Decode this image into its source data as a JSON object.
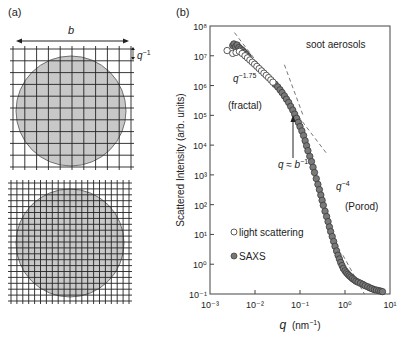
{
  "panel_a": {
    "label": "(a)",
    "dimension_label": "b",
    "grid_spacing_label": "q",
    "grid_spacing_exponent": "−1",
    "top_grid": {
      "divisions": 10,
      "circle_fill": "#c8c8c8"
    },
    "bottom_grid": {
      "divisions": 20,
      "circle_fill": "#c8c8c8"
    }
  },
  "panel_b": {
    "label": "(b)",
    "annotations": {
      "sample": "soot aerosols",
      "fractal_slope_base": "q",
      "fractal_slope_exp": "−1.75",
      "fractal_regime": "(fractal)",
      "crossover_base": "q ≈ b",
      "crossover_exp": "−1",
      "porod_slope_base": "q",
      "porod_slope_exp": "−4",
      "porod_regime": "(Porod)"
    },
    "legend": [
      {
        "label": "light scattering",
        "marker": "open-circle"
      },
      {
        "label": "SAXS",
        "marker": "filled-circle"
      }
    ]
  },
  "chart_data": {
    "type": "scatter",
    "title": "",
    "xlabel": "q (nm⁻¹)",
    "ylabel": "Scattered Intensity (arb. units)",
    "xscale": "log",
    "yscale": "log",
    "xlim": [
      0.001,
      10
    ],
    "ylim": [
      0.1,
      100000000
    ],
    "x_ticks": [
      "10⁻³",
      "10⁻²",
      "10⁻¹",
      "10⁰",
      "10¹"
    ],
    "y_ticks": [
      "10⁻¹",
      "10⁰",
      "10¹",
      "10²",
      "10³",
      "10⁴",
      "10⁵",
      "10⁶",
      "10⁷",
      "10⁸"
    ],
    "grid": false,
    "legend_position": "lower-left",
    "series": [
      {
        "name": "light scattering",
        "marker": "open-circle",
        "x": [
          0.0024,
          0.0032,
          0.0038,
          0.0045,
          0.0052,
          0.006,
          0.0068,
          0.0077,
          0.0087,
          0.0098,
          0.011,
          0.0124,
          0.014,
          0.0158,
          0.0178,
          0.02,
          0.0225,
          0.025
        ],
        "y": [
          15000000,
          12000000,
          13000000,
          14000000,
          12000000,
          10000000,
          8500000,
          7200000,
          6100000,
          5200000,
          4400000,
          3700000,
          3100000,
          2600000,
          2200000,
          1850000,
          1550000,
          1300000
        ]
      },
      {
        "name": "SAXS",
        "marker": "filled-circle",
        "x": [
          0.0032,
          0.0034,
          0.0037,
          0.004,
          0.0044,
          0.0048,
          0.0053,
          0.0058,
          0.0064,
          0.007,
          0.028,
          0.032,
          0.036,
          0.04,
          0.045,
          0.05,
          0.056,
          0.062,
          0.069,
          0.076,
          0.084,
          0.092,
          0.1,
          0.11,
          0.12,
          0.13,
          0.14,
          0.15,
          0.165,
          0.18,
          0.195,
          0.21,
          0.23,
          0.25,
          0.27,
          0.29,
          0.31,
          0.33,
          0.36,
          0.39,
          0.42,
          0.45,
          0.48,
          0.52,
          0.56,
          0.6,
          0.65,
          0.7,
          0.75,
          0.8,
          0.86,
          0.92,
          1.0,
          1.08,
          1.16,
          1.25,
          1.35,
          1.46,
          1.6,
          1.75,
          1.95,
          2.2,
          2.5,
          2.8,
          3.2,
          3.6,
          4.0,
          4.5,
          5.0,
          5.6,
          6.2,
          6.8
        ],
        "y": [
          22000000,
          25000000,
          20000000,
          23000000,
          19000000,
          17000000,
          15000000,
          13000000,
          11000000,
          9500000,
          1100000,
          900000,
          720000,
          580000,
          450000,
          350000,
          270000,
          200000,
          150000,
          110000,
          80000,
          58000,
          42000,
          30000,
          21000,
          14000,
          9500,
          6500,
          4200,
          2800,
          1800,
          1200,
          750,
          480,
          320,
          210,
          140,
          95,
          60,
          40,
          27,
          18,
          12.5,
          8.5,
          5.8,
          4.0,
          2.8,
          2.0,
          1.5,
          1.15,
          0.9,
          0.72,
          0.6,
          0.52,
          0.46,
          0.41,
          0.37,
          0.33,
          0.3,
          0.27,
          0.25,
          0.23,
          0.21,
          0.19,
          0.175,
          0.16,
          0.15,
          0.14,
          0.135,
          0.13,
          0.125,
          0.12
        ]
      }
    ],
    "guide_lines": [
      {
        "name": "q^-1.75",
        "from": [
          0.0035,
          60000000
        ],
        "to": [
          0.4,
          5000
        ]
      },
      {
        "name": "q^-4 (upper)",
        "from": [
          0.045,
          5000000
        ],
        "to": [
          0.12,
          90000
        ]
      },
      {
        "name": "q^-4",
        "from": [
          0.9,
          2.0
        ],
        "to": [
          2.7,
          0.1
        ]
      }
    ]
  }
}
